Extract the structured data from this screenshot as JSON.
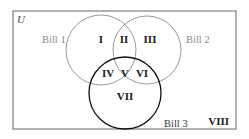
{
  "diagram": {
    "type": "venn",
    "universe_label": "U",
    "sets": [
      {
        "name": "Bill 1",
        "color": "#8a8a8a"
      },
      {
        "name": "Bill 2",
        "color": "#8a8a8a"
      },
      {
        "name": "Bill 3",
        "color": "#111111"
      }
    ],
    "regions": {
      "r1": "I",
      "r2": "II",
      "r3": "III",
      "r4": "IV",
      "r5": "V",
      "r6": "VI",
      "r7": "VII",
      "r8": "VIII"
    },
    "colors": {
      "border": "#666666",
      "light_circle": "#9a9a9a",
      "dark_circle": "#111111"
    }
  }
}
